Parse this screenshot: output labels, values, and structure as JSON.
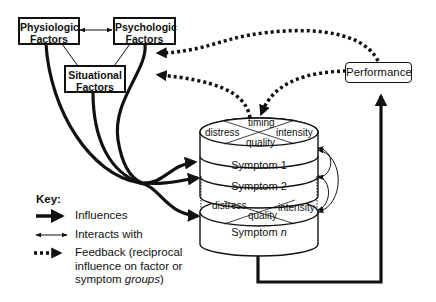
{
  "factors": {
    "physiologic": {
      "line1": "Physiologic",
      "line2": "Factors"
    },
    "psychologic": {
      "line1": "Psychologic",
      "line2": "Factors"
    },
    "situational": {
      "line1": "Situational",
      "line2": "Factors"
    }
  },
  "performance": {
    "label": "Performance"
  },
  "symptoms": {
    "top_dimensions": {
      "timing": "timing",
      "distress": "distress",
      "intensity": "intensity",
      "quality": "quality"
    },
    "bottom_dimensions": {
      "distress": "distress",
      "intensity": "intensity",
      "quality": "quality"
    },
    "symptom1": "Symptom 1",
    "symptom2": "Symptom 2",
    "symptomn_prefix": "Symptom ",
    "symptomn_var": "n"
  },
  "key": {
    "title": "Key:",
    "influences": "Influences",
    "interacts": "Interacts with",
    "feedback_line1": "Feedback (reciprocal",
    "feedback_line2": "influence on factor or",
    "feedback_line3_prefix": "symptom ",
    "feedback_line3_italic": "groups",
    "feedback_line3_suffix": ")"
  }
}
